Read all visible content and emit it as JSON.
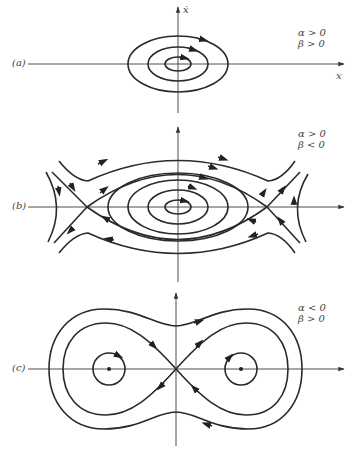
{
  "figure": {
    "panels": [
      {
        "id": "a",
        "label": "(a)",
        "conditions": [
          "α > 0",
          "β > 0"
        ],
        "x_axis_label": "x",
        "y_axis_label": "ẋ",
        "description": "Nested closed orbits (center) around origin"
      },
      {
        "id": "b",
        "label": "(b)",
        "conditions": [
          "α > 0",
          "β < 0"
        ],
        "description": "Center at origin with two saddle points and heteroclinic separatrices"
      },
      {
        "id": "c",
        "label": "(c)",
        "conditions": [
          "α < 0",
          "β > 0"
        ],
        "description": "Saddle at origin with homoclinic figure-eight separatrix and two centers"
      }
    ],
    "colors": {
      "stroke": "#2a2a2a",
      "axis": "#3a3a3a",
      "background": "#ffffff"
    }
  }
}
